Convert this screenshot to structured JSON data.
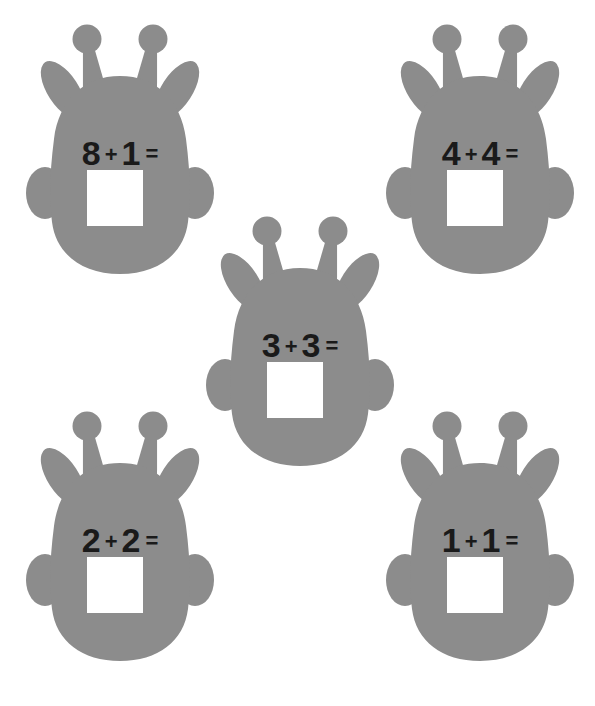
{
  "page": {
    "background_color": "#ffffff",
    "width": 595,
    "height": 706
  },
  "style": {
    "giraffe_color": "#8c8c8c",
    "text_color": "#1a1a1a",
    "answer_box_color": "#ffffff"
  },
  "icons": {
    "giraffe": "giraffe-head-icon",
    "ossicone": "ossicone-icon",
    "ear": "ear-icon"
  },
  "problems": [
    {
      "id": "problem-1",
      "position": "top-left",
      "left_operand": "8",
      "operator": "+",
      "right_operand": "1",
      "equals": "=",
      "answer": "",
      "x": 25,
      "y": 18
    },
    {
      "id": "problem-2",
      "position": "top-right",
      "left_operand": "4",
      "operator": "+",
      "right_operand": "4",
      "equals": "=",
      "answer": "",
      "x": 385,
      "y": 18
    },
    {
      "id": "problem-3",
      "position": "center",
      "left_operand": "3",
      "operator": "+",
      "right_operand": "3",
      "equals": "=",
      "answer": "",
      "x": 205,
      "y": 210
    },
    {
      "id": "problem-4",
      "position": "bottom-left",
      "left_operand": "2",
      "operator": "+",
      "right_operand": "2",
      "equals": "=",
      "answer": "",
      "x": 25,
      "y": 405
    },
    {
      "id": "problem-5",
      "position": "bottom-right",
      "left_operand": "1",
      "operator": "+",
      "right_operand": "1",
      "equals": "=",
      "answer": "",
      "x": 385,
      "y": 405
    }
  ]
}
